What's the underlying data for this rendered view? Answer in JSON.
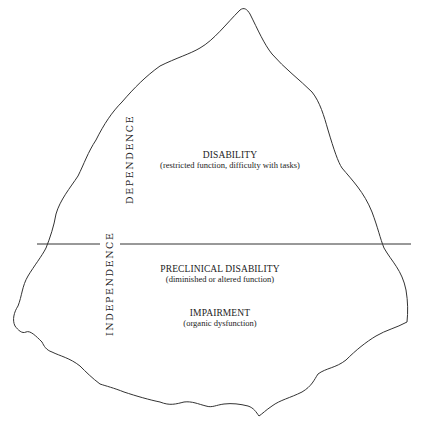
{
  "diagram": {
    "type": "iceberg",
    "waterline": {
      "y": 244,
      "x_start": 37,
      "x_end": 411,
      "gap": [
        100,
        120
      ]
    },
    "axis_labels": {
      "above": "DEPENDENCE",
      "below": "INDEPENDENCE"
    },
    "regions": [
      {
        "title": "DISABILITY",
        "subtitle": "(restricted function, difficulty with tasks)"
      },
      {
        "title": "PRECLINICAL DISABILITY",
        "subtitle": "(diminished or altered function)"
      },
      {
        "title": "IMPAIRMENT",
        "subtitle": "(organic dysfunction)"
      }
    ],
    "colors": {
      "stroke": "#333333",
      "background": "#ffffff"
    }
  }
}
